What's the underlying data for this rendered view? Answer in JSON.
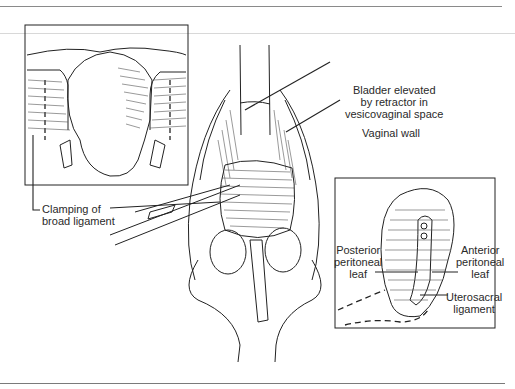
{
  "figure": {
    "labels": {
      "bladder": [
        "Bladder elevated",
        "by retractor in",
        "vesicovaginal space"
      ],
      "vaginal_wall": "Vaginal wall",
      "clamping": [
        "Clamping of",
        "broad ligament"
      ],
      "posterior": [
        "Posterior",
        "peritoneal",
        "leaf"
      ],
      "anterior": [
        "Anterior",
        "peritoneal",
        "leaf"
      ],
      "uterosacral": [
        "Uterosacral",
        "ligament"
      ]
    },
    "colors": {
      "ink": "#222222",
      "rule": "#8a8a8a"
    }
  }
}
